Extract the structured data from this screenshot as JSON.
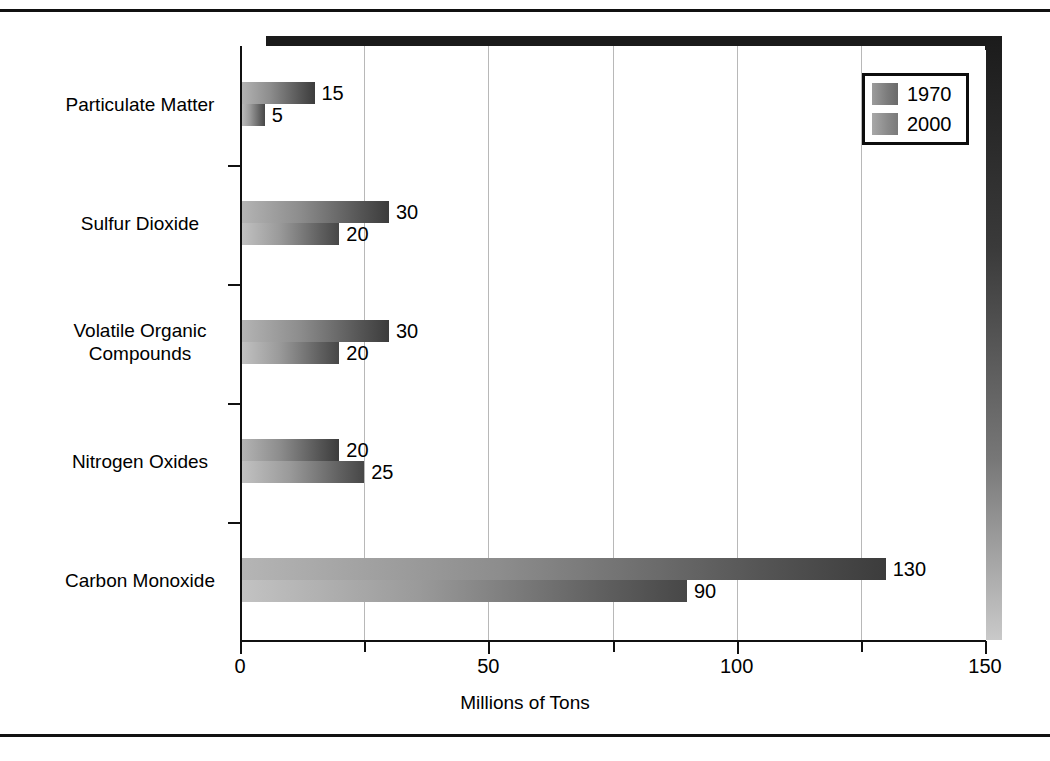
{
  "chart_data": {
    "type": "bar",
    "orientation": "horizontal",
    "title": "",
    "xlabel": "Millions of Tons",
    "ylabel": "",
    "xlim": [
      0,
      150
    ],
    "xticks": [
      0,
      25,
      50,
      75,
      100,
      125,
      150
    ],
    "xtick_labels": [
      "0",
      "",
      "50",
      "",
      "100",
      "",
      "150"
    ],
    "grid": "vertical",
    "legend_position": "top-right",
    "categories": [
      "Particulate Matter",
      "Sulfur Dioxide",
      "Volatile Organic Compounds",
      "Nitrogen Oxides",
      "Carbon Monoxide"
    ],
    "series": [
      {
        "name": "1970",
        "values": [
          15,
          30,
          30,
          20,
          130
        ]
      },
      {
        "name": "2000",
        "values": [
          5,
          20,
          20,
          25,
          90
        ]
      }
    ]
  },
  "axis": {
    "x_title": "Millions of Tons",
    "tick_labels": [
      {
        "value": 0,
        "text": "0"
      },
      {
        "value": 50,
        "text": "50"
      },
      {
        "value": 100,
        "text": "100"
      },
      {
        "value": 150,
        "text": "150"
      }
    ]
  },
  "categories": [
    {
      "label_line1": "Particulate Matter",
      "label_line2": ""
    },
    {
      "label_line1": "Sulfur Dioxide",
      "label_line2": ""
    },
    {
      "label_line1": "Volatile Organic",
      "label_line2": "Compounds"
    },
    {
      "label_line1": "Nitrogen Oxides",
      "label_line2": ""
    },
    {
      "label_line1": "Carbon Monoxide",
      "label_line2": ""
    }
  ],
  "bars": [
    {
      "category": "Particulate Matter",
      "series": "1970",
      "value": 15,
      "label": "15"
    },
    {
      "category": "Particulate Matter",
      "series": "2000",
      "value": 5,
      "label": "5"
    },
    {
      "category": "Sulfur Dioxide",
      "series": "1970",
      "value": 30,
      "label": "30"
    },
    {
      "category": "Sulfur Dioxide",
      "series": "2000",
      "value": 20,
      "label": "20"
    },
    {
      "category": "Volatile Organic Compounds",
      "series": "1970",
      "value": 30,
      "label": "30"
    },
    {
      "category": "Volatile Organic Compounds",
      "series": "2000",
      "value": 20,
      "label": "20"
    },
    {
      "category": "Nitrogen Oxides",
      "series": "1970",
      "value": 20,
      "label": "20"
    },
    {
      "category": "Nitrogen Oxides",
      "series": "2000",
      "value": 25,
      "label": "25"
    },
    {
      "category": "Carbon Monoxide",
      "series": "1970",
      "value": 130,
      "label": "130"
    },
    {
      "category": "Carbon Monoxide",
      "series": "2000",
      "value": 90,
      "label": "90"
    }
  ],
  "legend": {
    "entries": [
      {
        "label": "1970",
        "swatch": "gradient-gray-dark"
      },
      {
        "label": "2000",
        "swatch": "gradient-gray-medium"
      }
    ]
  },
  "colors": {
    "axis": "#111111",
    "gridline": "#b8b8b8",
    "slab": "#1b1b1b",
    "background": "#ffffff"
  }
}
